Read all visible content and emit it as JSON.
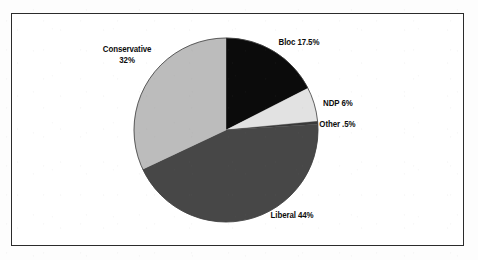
{
  "figure": {
    "background_color": "#fdfdfd",
    "frame_color": "#2b2b2b",
    "plot_background": "#ffffff"
  },
  "chart_data": {
    "type": "pie",
    "title": "",
    "subtitle": "",
    "xlabel": "",
    "ylabel": "",
    "grid": false,
    "legend_position": "none",
    "labels_position": "outside",
    "start_angle_deg": 0,
    "direction": "clockwise",
    "center": {
      "x": 226,
      "y": 130
    },
    "radius": 92,
    "categories": [
      "Bloc",
      "NDP",
      "Other",
      "Liberal",
      "Conservative"
    ],
    "values": [
      17.5,
      6,
      0.5,
      44,
      32
    ],
    "value_display": [
      "17.5%",
      "6%",
      ".5%",
      "44%",
      "32%"
    ],
    "colors": [
      "#0b0b0b",
      "#e2e2e2",
      "#3a3a3a",
      "#474747",
      "#bcbcbc"
    ],
    "slices": [
      {
        "name": "Bloc",
        "value": 17.5,
        "label": "Bloc 17.5%",
        "color": "#0b0b0b",
        "start_angle_deg": 0,
        "end_angle_deg": 63
      },
      {
        "name": "NDP",
        "value": 6,
        "label": "NDP 6%",
        "color": "#e2e2e2",
        "start_angle_deg": 63,
        "end_angle_deg": 84.6
      },
      {
        "name": "Other",
        "value": 0.5,
        "label": "Other .5%",
        "color": "#3a3a3a",
        "start_angle_deg": 84.6,
        "end_angle_deg": 86.4
      },
      {
        "name": "Liberal",
        "value": 44,
        "label": "Liberal 44%",
        "color": "#474747",
        "start_angle_deg": 86.4,
        "end_angle_deg": 244.8
      },
      {
        "name": "Conservative",
        "value": 32,
        "label_line1": "Conservative",
        "label_line2": "32%",
        "label": "Conservative 32%",
        "color": "#bcbcbc",
        "start_angle_deg": 244.8,
        "end_angle_deg": 360
      }
    ]
  }
}
